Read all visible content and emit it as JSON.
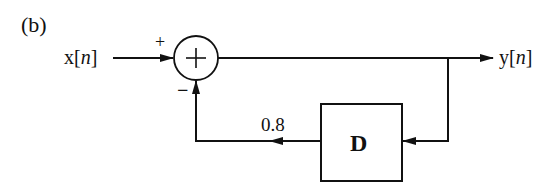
{
  "diagram": {
    "panel_label": "(b)",
    "input": {
      "name": "x",
      "index": "n"
    },
    "output": {
      "name": "y",
      "index": "n"
    },
    "summer": {
      "symbol": "+",
      "input_sign": "+",
      "feedback_sign": "−"
    },
    "delay_block": {
      "label": "D"
    },
    "feedback_gain": "0.8"
  }
}
